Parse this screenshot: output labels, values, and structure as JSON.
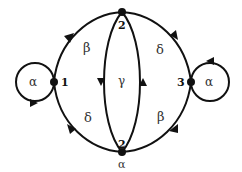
{
  "diagram": {
    "type": "directed-graph",
    "colors": {
      "stroke": "#111111",
      "label": "#333333",
      "background": "#ffffff"
    },
    "nodes": [
      {
        "id": "n1",
        "label": "1"
      },
      {
        "id": "n2top",
        "label": "2"
      },
      {
        "id": "n2bottom",
        "label": "2",
        "sublabel": "α"
      },
      {
        "id": "n3",
        "label": "3"
      }
    ],
    "edges": [
      {
        "id": "loop-1",
        "from": "1",
        "to": "1",
        "label": "α"
      },
      {
        "id": "e-1-2top",
        "from": "1",
        "to": "2 (top)",
        "label": "β"
      },
      {
        "id": "e-2top-3",
        "from": "2 (top)",
        "to": "3",
        "label": "δ"
      },
      {
        "id": "loop-3",
        "from": "3",
        "to": "3",
        "label": "α"
      },
      {
        "id": "e-2top-2bottom",
        "from": "2 (top)",
        "to": "2 (bottom)",
        "label": ""
      },
      {
        "id": "e-2bottom-2top",
        "from": "2 (bottom)",
        "to": "2 (top)",
        "label": ""
      },
      {
        "id": "e-2bottom-1",
        "from": "2 (bottom)",
        "to": "1",
        "label": "δ"
      },
      {
        "id": "e-3-2bottom",
        "from": "3",
        "to": "2 (bottom)",
        "label": "β"
      }
    ],
    "center_label": "γ"
  }
}
